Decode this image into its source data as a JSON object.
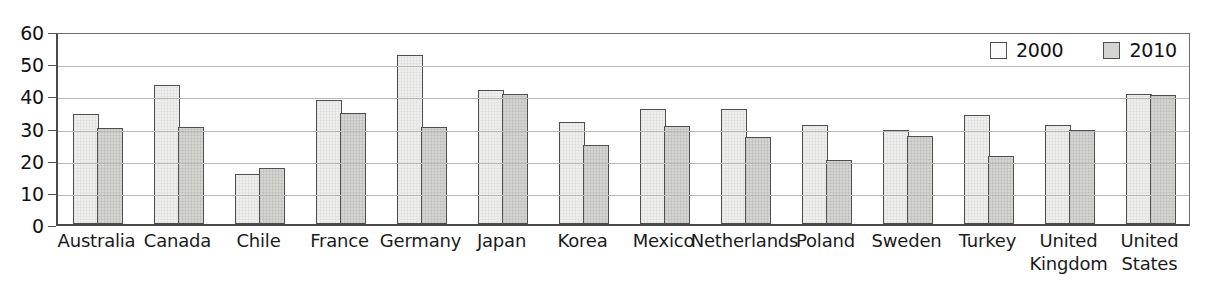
{
  "chart_data": {
    "type": "bar",
    "title": "",
    "subtitle": "",
    "xlabel": "",
    "ylabel": "",
    "ylim": [
      0,
      60
    ],
    "y_ticks": [
      0,
      10,
      20,
      30,
      40,
      50,
      60
    ],
    "grid": true,
    "legend_position": "top-right inside plot area",
    "categories": [
      "Australia",
      "Canada",
      "Chile",
      "France",
      "Germany",
      "Japan",
      "Korea",
      "Mexico",
      "Netherlands",
      "Poland",
      "Sweden",
      "Turkey",
      "United Kingdom",
      "United States"
    ],
    "series": [
      {
        "name": "2000",
        "color": "#eeeeec",
        "values": [
          34.3,
          43.3,
          15.5,
          38.4,
          52.5,
          41.7,
          31.8,
          35.8,
          35.8,
          30.7,
          29.1,
          33.9,
          30.9,
          40.5
        ]
      },
      {
        "name": "2010",
        "color": "#d4d4d1",
        "values": [
          30.0,
          30.1,
          17.5,
          34.6,
          30.3,
          40.5,
          24.5,
          30.6,
          27.1,
          20.0,
          27.3,
          21.0,
          29.2,
          40.2
        ]
      }
    ]
  },
  "legend": {
    "items": [
      {
        "label": "2000",
        "swatch": "legend-swatch-2000"
      },
      {
        "label": "2010",
        "swatch": "legend-swatch-2010"
      }
    ]
  },
  "colors": {
    "series_2000_fill": "#eeeeec",
    "series_2010_fill": "#d4d4d1",
    "bar_border": "#4f4f4f",
    "gridline": "#b9b9b9",
    "axis": "#4a4a4a",
    "text": "#1b1b1b",
    "background": "#ffffff"
  }
}
